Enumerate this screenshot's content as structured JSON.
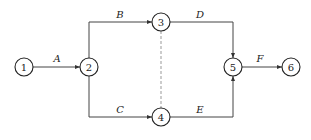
{
  "diagram": {
    "type": "activity-on-arrow network",
    "nodes": [
      {
        "id": "1",
        "label": "1",
        "x": 24,
        "y": 67
      },
      {
        "id": "2",
        "label": "2",
        "x": 89,
        "y": 67
      },
      {
        "id": "3",
        "label": "3",
        "x": 161,
        "y": 22
      },
      {
        "id": "4",
        "label": "4",
        "x": 161,
        "y": 117
      },
      {
        "id": "5",
        "label": "5",
        "x": 233,
        "y": 67
      },
      {
        "id": "6",
        "label": "6",
        "x": 291,
        "y": 67
      }
    ],
    "edges": [
      {
        "from": "1",
        "to": "2",
        "label": "A",
        "style": "solid"
      },
      {
        "from": "2",
        "to": "3",
        "label": "B",
        "style": "solid"
      },
      {
        "from": "2",
        "to": "4",
        "label": "C",
        "style": "solid"
      },
      {
        "from": "3",
        "to": "5",
        "label": "D",
        "style": "solid"
      },
      {
        "from": "4",
        "to": "5",
        "label": "E",
        "style": "solid"
      },
      {
        "from": "5",
        "to": "6",
        "label": "F",
        "style": "solid"
      },
      {
        "from": "3",
        "to": "4",
        "label": "",
        "style": "dashed"
      }
    ]
  }
}
